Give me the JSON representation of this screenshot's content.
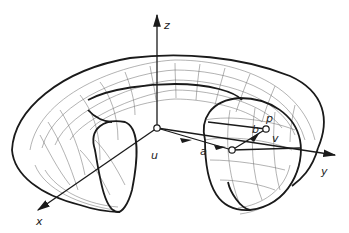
{
  "figure": {
    "colors": {
      "stroke": "#1a1a1a",
      "mesh": "#555555",
      "background": "#ffffff"
    },
    "axes": {
      "x": {
        "label": "x"
      },
      "y": {
        "label": "y"
      },
      "z": {
        "label": "z"
      }
    },
    "points": {
      "u": {
        "label": "u"
      },
      "a": {
        "label": "a"
      },
      "b": {
        "label": "b"
      },
      "p": {
        "label": "p"
      },
      "v": {
        "label": "v"
      }
    }
  }
}
